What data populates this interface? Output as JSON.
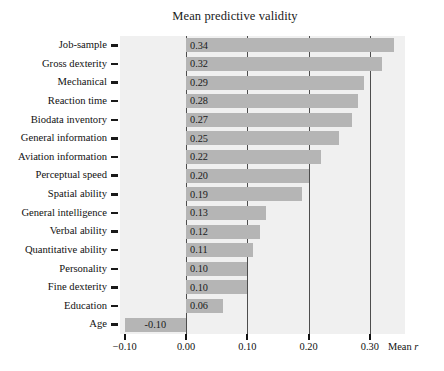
{
  "chart_data": {
    "type": "bar",
    "orientation": "horizontal",
    "title": "Mean predictive validity",
    "xlabel": "Mean r",
    "ylabel": "",
    "xlim": [
      -0.1,
      0.3715
    ],
    "xticks": [
      -0.1,
      0.0,
      0.1,
      0.2,
      0.3
    ],
    "xticklabels": [
      "−0.10",
      "0.00",
      "0.10",
      "0.20",
      "0.30"
    ],
    "gridlines_x": [
      0.0,
      0.1,
      0.2,
      0.3
    ],
    "grid": true,
    "legend": "none",
    "bar_color": "#b5b5b5",
    "panel_color": "#f0f0f0",
    "categories": [
      "Job-sample",
      "Gross dexterity",
      "Mechanical",
      "Reaction time",
      "Biodata inventory",
      "General information",
      "Aviation information",
      "Perceptual speed",
      "Spatial ability",
      "General intelligence",
      "Verbal ability",
      "Quantitative ability",
      "Personality",
      "Fine dexterity",
      "Education",
      "Age"
    ],
    "values": [
      0.34,
      0.32,
      0.29,
      0.28,
      0.27,
      0.25,
      0.22,
      0.2,
      0.19,
      0.13,
      0.12,
      0.11,
      0.1,
      0.1,
      0.06,
      -0.1
    ],
    "value_labels": [
      "0.34",
      "0.32",
      "0.29",
      "0.28",
      "0.27",
      "0.25",
      "0.22",
      "0.20",
      "0.19",
      "0.13",
      "0.12",
      "0.11",
      "0.10",
      "0.10",
      "0.06",
      "-0.10"
    ]
  },
  "axis_title": {
    "prefix": "Mean ",
    "symbol": "r"
  }
}
